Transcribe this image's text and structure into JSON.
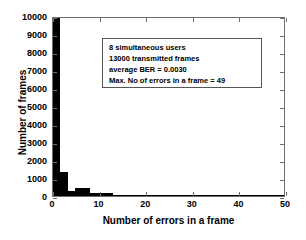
{
  "chart_data": {
    "type": "bar",
    "title": "",
    "xlabel": "Number of errors in a frame",
    "ylabel": "Number of frames",
    "xlim": [
      0,
      50
    ],
    "ylim": [
      0,
      10000
    ],
    "xticks": [
      0,
      10,
      20,
      30,
      40,
      50
    ],
    "yticks": [
      0,
      1000,
      2000,
      3000,
      4000,
      5000,
      6000,
      7000,
      8000,
      9000,
      10000
    ],
    "xtick_labels": [
      "0",
      "10",
      "20",
      "30",
      "40",
      "50"
    ],
    "ytick_labels": [
      "0",
      "1000",
      "2000",
      "3000",
      "4000",
      "5000",
      "6000",
      "7000",
      "8000",
      "9000",
      "10000"
    ],
    "grid": false,
    "legend": null,
    "bar_color": "#000000",
    "bin_width": 1.6,
    "bins": [
      {
        "x": 0.0,
        "value": 10000
      },
      {
        "x": 1.6,
        "value": 1320
      },
      {
        "x": 3.2,
        "value": 260
      },
      {
        "x": 4.8,
        "value": 430
      },
      {
        "x": 6.4,
        "value": 420
      },
      {
        "x": 8.0,
        "value": 175
      },
      {
        "x": 9.6,
        "value": 175
      },
      {
        "x": 11.2,
        "value": 165
      },
      {
        "x": 12.8,
        "value": 75
      },
      {
        "x": 14.4,
        "value": 70
      },
      {
        "x": 16.0,
        "value": 60
      },
      {
        "x": 17.6,
        "value": 25
      },
      {
        "x": 19.2,
        "value": 20
      },
      {
        "x": 20.8,
        "value": 15
      },
      {
        "x": 22.4,
        "value": 12
      },
      {
        "x": 24.0,
        "value": 10
      },
      {
        "x": 25.6,
        "value": 8
      },
      {
        "x": 27.2,
        "value": 7
      },
      {
        "x": 28.8,
        "value": 6
      },
      {
        "x": 30.4,
        "value": 5
      },
      {
        "x": 32.0,
        "value": 5
      },
      {
        "x": 33.6,
        "value": 4
      },
      {
        "x": 35.2,
        "value": 3
      },
      {
        "x": 36.8,
        "value": 3
      },
      {
        "x": 38.4,
        "value": 3
      },
      {
        "x": 40.0,
        "value": 2
      },
      {
        "x": 41.6,
        "value": 2
      },
      {
        "x": 43.2,
        "value": 2
      },
      {
        "x": 44.8,
        "value": 1
      },
      {
        "x": 46.4,
        "value": 1
      },
      {
        "x": 48.0,
        "value": 1
      }
    ],
    "annotations": [
      "8 simultaneous users",
      "13000 transmitted frames",
      "average BER = 0.0030",
      "Max. No of errors in a frame = 49"
    ]
  }
}
